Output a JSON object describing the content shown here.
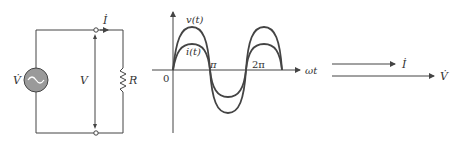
{
  "circuit": {
    "source_label": "V̇",
    "voltage_label": "V",
    "current_label": "İ",
    "resistor_label": "R"
  },
  "waveform": {
    "v_label": "v(t)",
    "i_label": "i(t)",
    "origin_label": "0",
    "pi_label": "π",
    "two_pi_label": "2π",
    "x_axis_label": "ωt"
  },
  "phasor": {
    "current_label": "İ",
    "voltage_label": "V̇"
  },
  "colors": {
    "line": "#444444",
    "source_fill": "#9a9a9a"
  }
}
